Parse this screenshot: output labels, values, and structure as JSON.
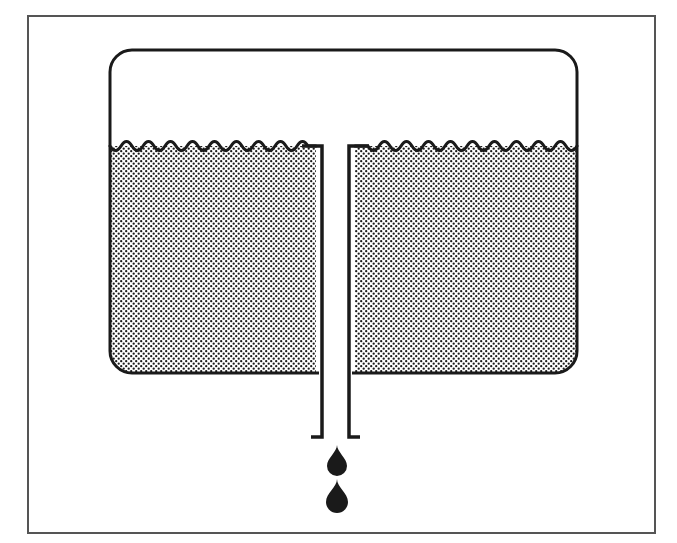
{
  "figure": {
    "title": "Leaking container with drain tube",
    "style": "black-and-white line drawing with halftone dot fill",
    "background_color": "#ffffff",
    "line_color": "#1a1a1a",
    "fill_pattern_color": "#1a1a1a",
    "liquid_fill_background": "#ffffff"
  },
  "frame": {
    "name": "outer border",
    "x": 28,
    "y": 16,
    "width": 627,
    "height": 517,
    "stroke_width": 2,
    "stroke_color": "#555555"
  },
  "container": {
    "name": "vessel",
    "x": 110,
    "y": 50,
    "width": 467,
    "height": 323,
    "corner_radius": 22,
    "stroke_width": 3,
    "stroke_color": "#1a1a1a",
    "open_top": true
  },
  "liquid": {
    "name": "liquid body",
    "surface_y": 146,
    "bottom_y": 373,
    "left_x": 110,
    "right_x": 577,
    "fill": "halftone-dots",
    "dot_spacing_px": 5,
    "dot_radius_px": 1.1,
    "wave": {
      "style": "scallop",
      "wavelength_px": 22,
      "amplitude_px": 6,
      "stroke_width": 3
    }
  },
  "tube": {
    "name": "drain tube",
    "outer_left_x": 316,
    "outer_right_x": 355,
    "inner_left_x": 322,
    "inner_right_x": 349,
    "top_y": 146,
    "bottom_y": 437,
    "wall_thickness": 6,
    "stroke_width": 3,
    "top_flange_width": 14,
    "bottom_flange_width": 11,
    "open_top": true,
    "open_bottom": true
  },
  "droplets": [
    {
      "name": "drop-upper",
      "center_x": 337,
      "tip_y": 445,
      "width": 19,
      "height": 28,
      "fill": "#1a1a1a"
    },
    {
      "name": "drop-lower",
      "center_x": 337,
      "tip_y": 479,
      "width": 21,
      "height": 30,
      "fill": "#1a1a1a"
    }
  ],
  "labels": {
    "none_visible": ""
  }
}
